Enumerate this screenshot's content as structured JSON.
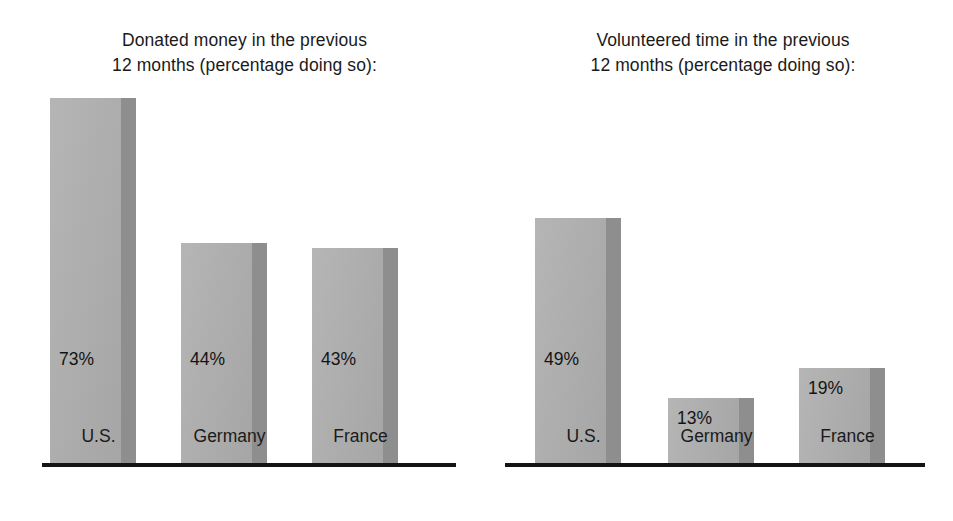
{
  "chart_data": [
    {
      "type": "bar",
      "title": "Donated money in the previous\n12 months (percentage doing so):",
      "categories": [
        "U.S.",
        "Germany",
        "France"
      ],
      "values": [
        73,
        44,
        43
      ],
      "value_labels": [
        "73%",
        "44%",
        "43%"
      ],
      "xlabel": "",
      "ylabel": "",
      "ylim": [
        0,
        80
      ],
      "grid": false,
      "legend": "none",
      "axis_visible": "x-only",
      "bar_style": "pseudo-3d",
      "colors": {
        "bar_front": "#adadad",
        "bar_side": "#8e8e8e",
        "axis": "#141414",
        "text": "#1a1a1a",
        "background": "#ffffff"
      }
    },
    {
      "type": "bar",
      "title": "Volunteered time in the previous\n12 months (percentage doing so):",
      "categories": [
        "U.S.",
        "Germany",
        "France"
      ],
      "values": [
        49,
        13,
        19
      ],
      "value_labels": [
        "49%",
        "13%",
        "19%"
      ],
      "xlabel": "",
      "ylabel": "",
      "ylim": [
        0,
        80
      ],
      "grid": false,
      "legend": "none",
      "axis_visible": "x-only",
      "bar_style": "pseudo-3d",
      "colors": {
        "bar_front": "#adadad",
        "bar_side": "#8e8e8e",
        "axis": "#141414",
        "text": "#1a1a1a",
        "background": "#ffffff"
      }
    }
  ]
}
